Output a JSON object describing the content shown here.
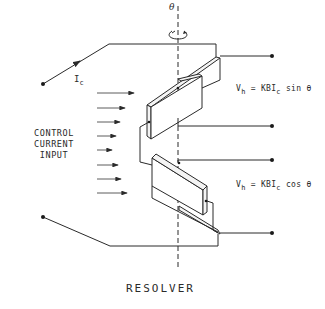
{
  "diagram": {
    "title": "RESOLVER",
    "rotation_axis_label": "θ",
    "control_current_label": "I",
    "control_current_subscript": "c",
    "input_label_lines": [
      "CONTROL",
      "CURRENT",
      "INPUT"
    ],
    "output_sin": {
      "lhs": "V",
      "lhs_sub": "h",
      "eq": " = KBI",
      "mid_sub": "c",
      "rhs": " sin θ"
    },
    "output_cos": {
      "lhs": "V",
      "lhs_sub": "h",
      "eq": " = KBI",
      "mid_sub": "c",
      "rhs": " cos θ"
    },
    "field_arrow_count": 8,
    "colors": {
      "ink": "#2a2a2a",
      "background": "#ffffff"
    }
  }
}
